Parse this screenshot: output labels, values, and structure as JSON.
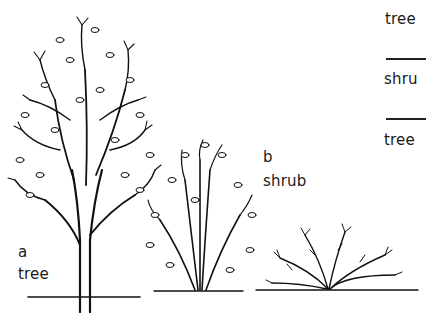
{
  "figure": {
    "panels": [
      {
        "id": "a",
        "letter": "a",
        "name": "tree"
      },
      {
        "id": "b",
        "letter": "b",
        "name": "shrub"
      },
      {
        "id": "c",
        "letter": "",
        "name": ""
      }
    ],
    "side_list": {
      "items": [
        "tree",
        "shrub",
        "tree"
      ],
      "visible_text": [
        "tree",
        "shru",
        "tree"
      ]
    }
  },
  "colors": {
    "ink": "#111111",
    "background": "#ffffff"
  }
}
